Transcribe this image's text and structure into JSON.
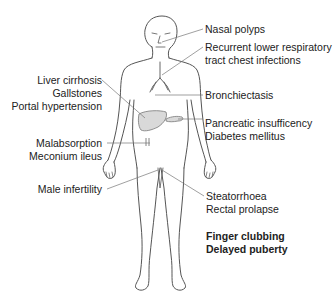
{
  "diagram": {
    "labels_right": {
      "nasal": [
        "Nasal polyps"
      ],
      "respiratory": [
        "Recurrent lower respiratory",
        "tract chest infections"
      ],
      "bronchi": [
        "Bronchiectasis"
      ],
      "pancreas": [
        "Pancreatic insufficency",
        "Diabetes mellitus"
      ],
      "bowel": [
        "Steatorrhoea",
        "Rectal prolapse"
      ],
      "general": [
        "Finger clubbing",
        "Delayed puberty"
      ]
    },
    "labels_left": {
      "liver": [
        "Liver cirrhosis",
        "Gallstones",
        "Portal hypertension"
      ],
      "intestine": [
        "Malabsorption",
        "Meconium ileus"
      ],
      "reproductive": [
        "Male infertility"
      ]
    },
    "colors": {
      "outline": "#555555",
      "organ_fill": "#d9d9d9",
      "leader_line": "#777777",
      "text": "#222222"
    }
  }
}
